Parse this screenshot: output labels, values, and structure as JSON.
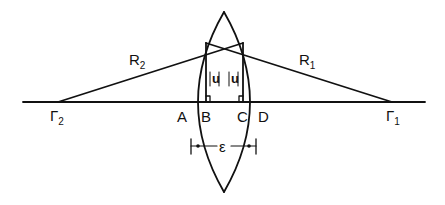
{
  "diagram": {
    "type": "thick-lens-geometry",
    "stroke_color": "#111111",
    "background": "#ffffff",
    "labels": {
      "gamma2": {
        "main": "Γ",
        "sub": "2"
      },
      "gamma1": {
        "main": "Γ",
        "sub": "1"
      },
      "r2": {
        "main": "R",
        "sub": "2"
      },
      "r1": {
        "main": "R",
        "sub": "1"
      },
      "A": "A",
      "B": "B",
      "C": "C",
      "D": "D",
      "u_left": "|u|",
      "u_right": "|u|",
      "epsilon": "ε"
    },
    "nodes": [
      {
        "id": "Γ2",
        "desc": "center of curvature of surface 2"
      },
      {
        "id": "Γ1",
        "desc": "center of curvature of surface 1"
      },
      {
        "id": "A",
        "desc": "left vertex of lens on axis"
      },
      {
        "id": "B",
        "desc": "foot of perpendicular |u|"
      },
      {
        "id": "C",
        "desc": "foot of perpendicular |u|"
      },
      {
        "id": "D",
        "desc": "right vertex of lens on axis"
      }
    ],
    "edges": [
      {
        "from": "Γ2",
        "to": "lens upper right",
        "label": "R2"
      },
      {
        "from": "Γ1",
        "to": "lens upper left",
        "label": "R1"
      },
      {
        "from": "A",
        "to": "D",
        "label": "ε (thickness)"
      }
    ]
  }
}
